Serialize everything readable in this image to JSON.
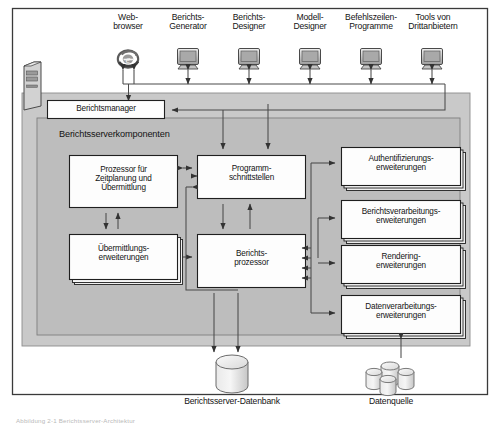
{
  "diagram": {
    "title": "Berichtsserver-Architektur",
    "clients": [
      {
        "id": "web-browser",
        "label": "Web-\nbrowser",
        "icon": "internet-explorer-icon",
        "x": 117,
        "y": 13
      },
      {
        "id": "berichts-generator",
        "label": "Berichts-\nGenerator",
        "icon": "monitor-icon",
        "x": 178,
        "y": 13
      },
      {
        "id": "berichts-designer",
        "label": "Berichts-\nDesigner",
        "icon": "monitor-icon",
        "x": 239,
        "y": 13
      },
      {
        "id": "modell-designer",
        "label": "Modell-\nDesigner",
        "icon": "monitor-icon",
        "x": 300,
        "y": 13
      },
      {
        "id": "befehlszeilen-programme",
        "label": "Befehlszeilen-\nProgramme",
        "icon": "monitor-icon",
        "x": 361,
        "y": 13
      },
      {
        "id": "tools-von-drittanbietern",
        "label": "Tools von\nDrittanbietern",
        "icon": "monitor-icon",
        "x": 422,
        "y": 13
      }
    ],
    "server_tower": {
      "id": "berichtsserver-tower",
      "icon": "server-tower-icon"
    },
    "manager": {
      "id": "berichtsmanager",
      "label": "Berichtsmanager"
    },
    "components_panel": {
      "id": "berichtsserverkomponenten",
      "label": "Berichtsserverkomponenten"
    },
    "core_boxes": [
      {
        "id": "prozessor-zeitplanung",
        "label": "Prozessor für\nZeitplanung und\nÜbermittlung",
        "x": 69,
        "y": 155,
        "w": 108,
        "h": 52,
        "stacked": false
      },
      {
        "id": "programmschnittstellen",
        "label": "Programm-\nschnittstellen",
        "x": 197,
        "y": 155,
        "w": 108,
        "h": 43,
        "stacked": false
      },
      {
        "id": "uebermittlungserweiterungen",
        "label": "Übermittlungs-\nerweiterungen",
        "x": 69,
        "y": 234,
        "w": 108,
        "h": 45,
        "stacked": true
      },
      {
        "id": "berichtsprozessor",
        "label": "Berichts-\nprozessor",
        "x": 197,
        "y": 234,
        "w": 108,
        "h": 53,
        "stacked": false
      }
    ],
    "extensions": [
      {
        "id": "authentifizierungserweiterungen",
        "label": "Authentifizierungs-\nerweiterungen",
        "x": 341,
        "y": 147,
        "w": 119,
        "h": 38
      },
      {
        "id": "berichtsverarbeitungserweiterungen",
        "label": "Berichtsverarbeitungs-\nerweiterungen",
        "x": 341,
        "y": 205,
        "w": 119,
        "h": 38
      },
      {
        "id": "renderingerweiterungen",
        "label": "Rendering-\nerweiterungen",
        "x": 341,
        "y": 245,
        "w": 119,
        "h": 38
      },
      {
        "id": "datenverarbeitungserweiterungen",
        "label": "Datenverarbeitungs-\nerweiterungen",
        "x": 341,
        "y": 295,
        "w": 119,
        "h": 38
      }
    ],
    "databases": [
      {
        "id": "berichtsserver-datenbank",
        "label": "Berichtsserver-Datenbank",
        "icon": "database-cylinder-icon",
        "x": 178,
        "y": 386
      },
      {
        "id": "datenquelle",
        "label": "Datenquelle",
        "icon": "database-cluster-icon",
        "x": 372,
        "y": 386
      }
    ],
    "caption": "Abbildung 2-1  Berichtsserver-Architektur"
  },
  "colors": {
    "page_background": "#ffffff",
    "frame_border": "#3a3a3a",
    "outer_panel_fill": "#c9c9c9",
    "inner_panel_fill": "#bdbdbd",
    "box_fill": "#fdfdfd",
    "box_border": "#1f1f1f",
    "connector": "#4a4a4a",
    "text": "#141414"
  }
}
